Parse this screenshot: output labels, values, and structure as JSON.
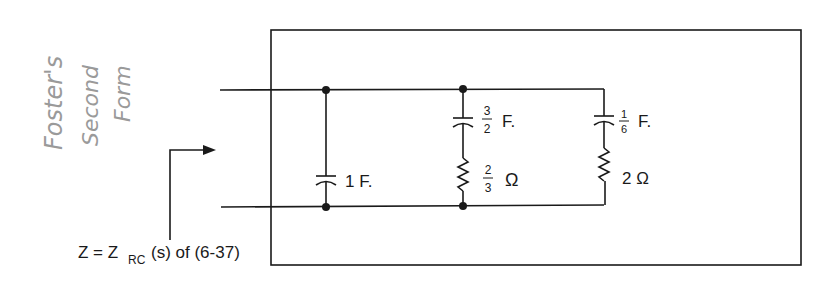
{
  "annotation": {
    "handwritten_lines": [
      "Foster's",
      "Second",
      "Form"
    ],
    "color": "#9a9a9a"
  },
  "circuit": {
    "input_label_prefix": "Z = Z",
    "input_label_sub": "RC",
    "input_label_suffix": "(s) of (6-37)",
    "branches": [
      {
        "id": "c1",
        "capacitor": "1 F."
      },
      {
        "id": "rc2",
        "capacitor_num": "3",
        "capacitor_den": "2",
        "capacitor_unit": "F.",
        "resistor_num": "2",
        "resistor_den": "3",
        "resistor_unit": "Ω"
      },
      {
        "id": "rc3",
        "capacitor_num": "1",
        "capacitor_den": "6",
        "capacitor_unit": "F.",
        "resistor": "2 Ω"
      }
    ],
    "line_color": "#1a1a1a"
  }
}
